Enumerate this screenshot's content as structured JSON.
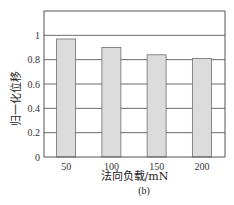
{
  "chart_data": {
    "type": "bar",
    "title": "",
    "caption": "(b)",
    "xlabel": "法向负载/mN",
    "ylabel": "归一化位移",
    "categories": [
      "50",
      "100",
      "150",
      "200"
    ],
    "values": [
      0.97,
      0.9,
      0.84,
      0.81
    ],
    "ylim": [
      0,
      1.2
    ],
    "yticks": [
      0,
      0.2,
      0.4,
      0.6,
      0.8,
      1
    ],
    "ytick_labels": [
      "0",
      "0.2",
      "0.4",
      "0.6",
      "0.8",
      "1"
    ],
    "grid": "horizontal",
    "legend": null,
    "colors": {
      "bar_fill": "#dcdcdc",
      "bar_stroke": "#6e6e6e",
      "frame": "#555555",
      "grid": "#444444"
    }
  }
}
